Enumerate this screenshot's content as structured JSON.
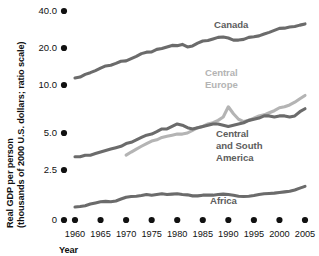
{
  "chart_data": {
    "type": "line",
    "title": "",
    "xlabel": "Year",
    "ylabel": "Real GDP per person (thousands of 2000 U.S. dollars; ratio scale)",
    "ylabel_line1": "Real GDP per person",
    "ylabel_line2": "(thousands of 2000 U.S. dollars; ratio scale)",
    "scale": "log",
    "grid": false,
    "legend_position": "inline-labels",
    "ylim": [
      1.0,
      40.0
    ],
    "xlim": [
      1960,
      2005
    ],
    "ytick_labels": [
      "40.0",
      "20.0",
      "10.0",
      "5.0",
      "2.5",
      "0"
    ],
    "ytick_values": [
      40.0,
      20.0,
      10.0,
      5.0,
      2.5,
      0
    ],
    "xtick_labels": [
      "1960",
      "1965",
      "1970",
      "1975",
      "1980",
      "1985",
      "1990",
      "1995",
      "2000",
      "2005"
    ],
    "xtick_values": [
      1960,
      1965,
      1970,
      1975,
      1980,
      1985,
      1990,
      1995,
      2000,
      2005
    ],
    "series": [
      {
        "name": "Canada",
        "color": "#6b6b6b",
        "label_text": "Canada",
        "x": [
          1960,
          1961,
          1962,
          1963,
          1964,
          1965,
          1966,
          1967,
          1968,
          1969,
          1970,
          1971,
          1972,
          1973,
          1974,
          1975,
          1976,
          1977,
          1978,
          1979,
          1980,
          1981,
          1982,
          1983,
          1984,
          1985,
          1986,
          1987,
          1988,
          1989,
          1990,
          1991,
          1992,
          1993,
          1994,
          1995,
          1996,
          1997,
          1998,
          1999,
          2000,
          2001,
          2002,
          2003,
          2004,
          2005
        ],
        "values": [
          11.4,
          11.6,
          12.2,
          12.6,
          13.1,
          13.7,
          14.3,
          14.5,
          15.0,
          15.6,
          15.7,
          16.4,
          17.1,
          18.0,
          18.5,
          18.6,
          19.5,
          19.8,
          20.4,
          21.0,
          20.9,
          21.4,
          20.4,
          20.8,
          21.9,
          22.8,
          23.0,
          23.7,
          24.4,
          24.6,
          24.1,
          23.2,
          23.2,
          23.5,
          24.4,
          24.7,
          25.1,
          26.0,
          26.8,
          27.8,
          28.9,
          29.0,
          29.6,
          29.9,
          30.7,
          31.4
        ]
      },
      {
        "name": "Central Europe",
        "color": "#b4b4b4",
        "label_text": "Central Europe",
        "label_line1": "Central",
        "label_line2": "Europe",
        "x": [
          1970,
          1971,
          1972,
          1973,
          1974,
          1975,
          1976,
          1977,
          1978,
          1979,
          1980,
          1981,
          1982,
          1983,
          1984,
          1985,
          1986,
          1987,
          1988,
          1989,
          1990,
          1991,
          1992,
          1993,
          1994,
          1995,
          1996,
          1997,
          1998,
          1999,
          2000,
          2001,
          2002,
          2003,
          2004,
          2005
        ],
        "values": [
          3.3,
          3.5,
          3.7,
          3.9,
          4.1,
          4.3,
          4.4,
          4.6,
          4.7,
          4.8,
          4.9,
          4.9,
          5.0,
          5.2,
          5.4,
          5.5,
          5.7,
          5.8,
          6.0,
          6.3,
          7.3,
          6.6,
          6.1,
          5.9,
          6.0,
          6.2,
          6.4,
          6.5,
          6.7,
          6.9,
          7.2,
          7.3,
          7.5,
          7.8,
          8.2,
          8.6
        ]
      },
      {
        "name": "Central and South America",
        "color": "#6b6b6b",
        "label_text": "Central and South America",
        "label_line1": "Central",
        "label_line2": "and South",
        "label_line3": "America",
        "x": [
          1960,
          1961,
          1962,
          1963,
          1964,
          1965,
          1966,
          1967,
          1968,
          1969,
          1970,
          1971,
          1972,
          1973,
          1974,
          1975,
          1976,
          1977,
          1978,
          1979,
          1980,
          1981,
          1982,
          1983,
          1984,
          1985,
          1986,
          1987,
          1988,
          1989,
          1990,
          1991,
          1992,
          1993,
          1994,
          1995,
          1996,
          1997,
          1998,
          1999,
          2000,
          2001,
          2002,
          2003,
          2004,
          2005
        ],
        "values": [
          3.2,
          3.2,
          3.3,
          3.3,
          3.4,
          3.5,
          3.6,
          3.7,
          3.8,
          3.9,
          4.1,
          4.2,
          4.4,
          4.6,
          4.8,
          4.9,
          5.1,
          5.3,
          5.3,
          5.5,
          5.7,
          5.6,
          5.4,
          5.3,
          5.4,
          5.5,
          5.6,
          5.7,
          5.7,
          5.6,
          5.5,
          5.6,
          5.7,
          5.8,
          6.0,
          6.1,
          6.2,
          6.4,
          6.4,
          6.3,
          6.4,
          6.4,
          6.3,
          6.4,
          6.8,
          7.1
        ]
      },
      {
        "name": "Africa",
        "color": "#6b6b6b",
        "label_text": "Africa",
        "x": [
          1960,
          1961,
          1962,
          1963,
          1964,
          1965,
          1966,
          1967,
          1968,
          1969,
          1970,
          1971,
          1972,
          1973,
          1974,
          1975,
          1976,
          1977,
          1978,
          1979,
          1980,
          1981,
          1982,
          1983,
          1984,
          1985,
          1986,
          1987,
          1988,
          1989,
          1990,
          1991,
          1992,
          1993,
          1994,
          1995,
          1996,
          1997,
          1998,
          1999,
          2000,
          2001,
          2002,
          2003,
          2004,
          2005
        ],
        "values": [
          1.25,
          1.26,
          1.28,
          1.32,
          1.35,
          1.38,
          1.39,
          1.38,
          1.4,
          1.45,
          1.5,
          1.52,
          1.53,
          1.55,
          1.58,
          1.56,
          1.58,
          1.6,
          1.58,
          1.59,
          1.6,
          1.58,
          1.57,
          1.54,
          1.54,
          1.56,
          1.56,
          1.56,
          1.58,
          1.59,
          1.58,
          1.56,
          1.53,
          1.52,
          1.53,
          1.55,
          1.58,
          1.6,
          1.61,
          1.62,
          1.64,
          1.66,
          1.68,
          1.72,
          1.78,
          1.84
        ]
      }
    ]
  },
  "axis": {
    "y_title_line1": "Real GDP per person",
    "y_title_line2": "(thousands of 2000 U.S. dollars; ratio scale)",
    "x_title": "Year"
  },
  "labels": {
    "canada": "Canada",
    "central_europe_l1": "Central",
    "central_europe_l2": "Europe",
    "csa_l1": "Central",
    "csa_l2": "and South",
    "csa_l3": "America",
    "africa": "Africa"
  },
  "ticks": {
    "y": [
      "40.0",
      "20.0",
      "10.0",
      "5.0",
      "2.5",
      "0"
    ],
    "x": [
      "1960",
      "1965",
      "1970",
      "1975",
      "1980",
      "1985",
      "1990",
      "1995",
      "2000",
      "2005"
    ]
  },
  "colors": {
    "dark_line": "#6b6b6b",
    "light_line": "#b4b4b4",
    "text": "#111111",
    "label_dark": "#5d5d5d",
    "label_light": "#b4b4b4"
  }
}
